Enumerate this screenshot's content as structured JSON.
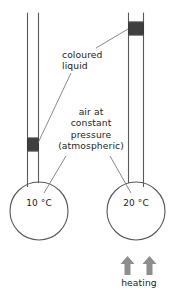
{
  "diagram": {
    "background_color": "#ffffff",
    "glass_stroke_color": "#595959",
    "leader_stroke_color": "#6b6b6b",
    "liquid_color": "#3f3f3f",
    "arrow_color": "#8e8e8e",
    "text_color": "#1d1d1d",
    "labels": {
      "coloured_liquid": "coloured\nliquid",
      "air_pressure": "air at\nconstant\npressure\n(atmospheric)",
      "temperature_left": "10 °C",
      "temperature_right": "20 °C",
      "heating": "heating"
    },
    "apparatus": {
      "left_flask": {
        "temperature": "10 °C",
        "liquid_index_position": "low",
        "heated": false
      },
      "right_flask": {
        "temperature": "20 °C",
        "liquid_index_position": "high",
        "heated": true
      },
      "heat_arrows": 2
    }
  }
}
